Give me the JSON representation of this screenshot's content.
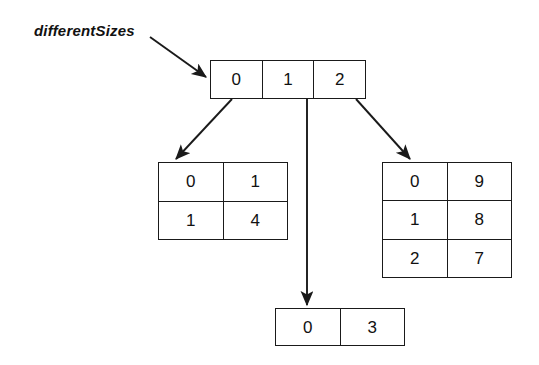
{
  "figure": {
    "background_color": "#ffffff",
    "line_color": "#1a1a1a",
    "text_color": "#111111"
  },
  "label": {
    "name": "differentSizes"
  },
  "root_array": {
    "name": "root-index-array",
    "cells": [
      "0",
      "1",
      "2"
    ]
  },
  "sub_arrays": {
    "left": {
      "name": "left-sub-array",
      "rows": [
        {
          "index": "0",
          "value": "1"
        },
        {
          "index": "1",
          "value": "4"
        }
      ]
    },
    "middle": {
      "name": "middle-sub-array",
      "rows": [
        {
          "index": "0",
          "value": "3"
        }
      ]
    },
    "right": {
      "name": "right-sub-array",
      "rows": [
        {
          "index": "0",
          "value": "9"
        },
        {
          "index": "1",
          "value": "8"
        },
        {
          "index": "2",
          "value": "7"
        }
      ]
    }
  }
}
